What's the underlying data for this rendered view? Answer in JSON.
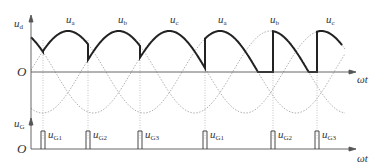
{
  "upper_plot": {
    "y_axis_label": "u",
    "y_axis_sub": "d",
    "origin_label": "O",
    "x_axis_label": "ωt",
    "phase_labels": [
      {
        "text": "u",
        "sub": "a",
        "x": 66
      },
      {
        "text": "u",
        "sub": "b",
        "x": 118
      },
      {
        "text": "u",
        "sub": "c",
        "x": 170
      },
      {
        "text": "u",
        "sub": "a",
        "x": 218
      },
      {
        "text": "u",
        "sub": "b",
        "x": 270
      },
      {
        "text": "u",
        "sub": "c",
        "x": 326
      }
    ]
  },
  "lower_plot": {
    "y_axis_label": "u",
    "y_axis_sub": "G",
    "origin_label": "O",
    "x_axis_label": "ωt",
    "pulses": [
      {
        "text": "u",
        "sub": "G1",
        "x": 43
      },
      {
        "text": "u",
        "sub": "G2",
        "x": 88
      },
      {
        "text": "u",
        "sub": "G3",
        "x": 140
      },
      {
        "text": "u",
        "sub": "G1",
        "x": 205
      },
      {
        "text": "u",
        "sub": "G2",
        "x": 273
      },
      {
        "text": "u",
        "sub": "G3",
        "x": 317
      }
    ]
  },
  "colors": {
    "axis": "#555555",
    "output_wave": "#222222",
    "phase_wave": "#999999",
    "grid_dotted": "#aaaaaa"
  }
}
